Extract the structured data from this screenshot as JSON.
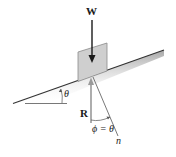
{
  "figure": {
    "labels": {
      "weight": "W",
      "reaction": "R",
      "incline_angle": "θ",
      "friction_angle": "ϕ = θ",
      "normal": "n"
    },
    "colors": {
      "ink": "#1a1a1a",
      "block_fill": "#cfcfcf",
      "block_stroke": "#8a8a8a",
      "reaction_arrow": "#8c8c8c",
      "incline_shadow": "#bdbdbd"
    }
  }
}
